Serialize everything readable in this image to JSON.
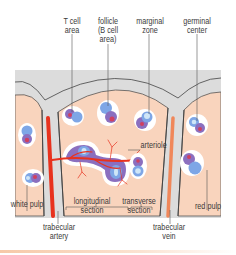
{
  "diagram": {
    "colors": {
      "capsule": "#dcdcdc",
      "capsule_outline": "#555555",
      "red_pulp": "#f9d4bd",
      "white_pulp_halo": "#ffffff",
      "lymphocyte_blue": "#7ea6e6",
      "lymphocyte_purple": "#8b6fbf",
      "germinal_light": "#cfe6f7",
      "artery": "#e8321e",
      "vein": "#f0875a",
      "arteriole": "#e8321e",
      "bottom_bar": "#f6c9a8"
    },
    "labels": {
      "t_cell_area": "T cell\narea",
      "follicle": "follicle\n(B cell\narea)",
      "marginal_zone": "marginal\nzone",
      "germinal_center": "germinal\ncenter",
      "arteriole": "arteriole",
      "white_pulp": "white pulp",
      "longitudinal_section": "longitudinal\nsection",
      "transverse_section": "transverse\nsection",
      "red_pulp": "red pulp",
      "trabecular_artery": "trabecular\nartery",
      "trabecular_vein": "trabecular\nvein"
    }
  }
}
